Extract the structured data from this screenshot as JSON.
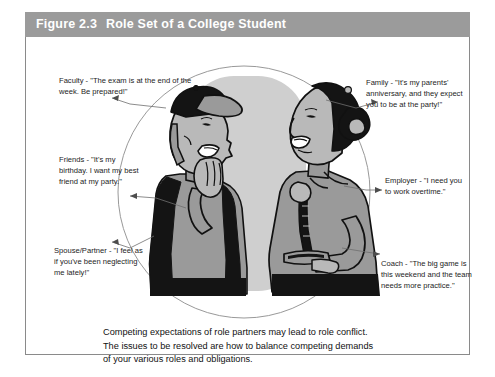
{
  "figure": {
    "number": "Figure 2.3",
    "title": "Role Set of a College Student"
  },
  "callouts": {
    "faculty": "Faculty - \"The exam is at the end of the week. Be prepared!\"",
    "friends": "Friends - \"It's my birthday. I want my best friend at my party.\"",
    "spouse": "Spouse/Partner - \"I feel as if you've been neglecting me lately!\"",
    "family": "Family - \"It's my parents' anniversary, and they expect you to be at the party!\"",
    "employer": "Employer - \"I need you to work overtime.\"",
    "coach": "Coach - \"The big game is this weekend and the team needs more practice.\""
  },
  "caption": {
    "line1": "Competing expectations of role partners may lead to role conflict.",
    "line2": "The issues to be resolved are how to balance competing demands",
    "line3": "of your various roles and obligations."
  },
  "illustration": {
    "alt": "Two students standing face to face in conversation inside a circle",
    "left_figure": "man-with-cap",
    "right_figure": "woman-with-bun"
  },
  "colors": {
    "header_bg": "#9b9b9b",
    "header_text": "#ffffff",
    "border": "#8a8a8a",
    "backdrop_gray": "#cfcfcf",
    "circle_stroke": "#8d8d8d",
    "figure_mid_gray": "#9a9a9a",
    "figure_dark": "#141414",
    "figure_light": "#b9b9b9"
  }
}
